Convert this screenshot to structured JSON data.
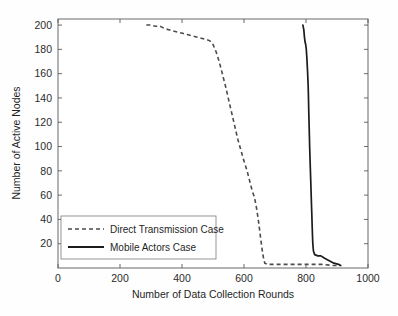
{
  "chart_data": {
    "type": "line",
    "title": "",
    "xlabel": "Number of Data Collection Rounds",
    "ylabel": "Number of Active Nodes",
    "xlim": [
      0,
      1000
    ],
    "ylim": [
      0,
      205
    ],
    "xticks": [
      0,
      200,
      400,
      600,
      800,
      1000
    ],
    "yticks": [
      20,
      40,
      60,
      80,
      100,
      120,
      140,
      160,
      180,
      200
    ],
    "xtick_labels": [
      "0",
      "200",
      "400",
      "600",
      "800",
      "1000"
    ],
    "ytick_labels": [
      "20",
      "40",
      "60",
      "80",
      "100",
      "120",
      "140",
      "160",
      "180",
      "200"
    ],
    "grid": false,
    "legend_position": "lower left",
    "series": [
      {
        "name": "Direct Transmission Case",
        "style": "dashed",
        "color": "#4b4b4b",
        "points": [
          [
            285,
            200
          ],
          [
            300,
            200
          ],
          [
            315,
            199
          ],
          [
            330,
            199
          ],
          [
            345,
            197
          ],
          [
            360,
            196
          ],
          [
            375,
            195
          ],
          [
            390,
            194
          ],
          [
            405,
            193
          ],
          [
            420,
            192
          ],
          [
            435,
            191
          ],
          [
            450,
            190
          ],
          [
            465,
            189
          ],
          [
            480,
            188
          ],
          [
            490,
            187
          ],
          [
            500,
            184
          ],
          [
            510,
            178
          ],
          [
            520,
            170
          ],
          [
            530,
            160
          ],
          [
            540,
            150
          ],
          [
            550,
            139
          ],
          [
            560,
            128
          ],
          [
            570,
            117
          ],
          [
            580,
            106
          ],
          [
            590,
            97
          ],
          [
            600,
            88
          ],
          [
            610,
            80
          ],
          [
            618,
            72
          ],
          [
            626,
            64
          ],
          [
            634,
            58
          ],
          [
            640,
            50
          ],
          [
            646,
            40
          ],
          [
            652,
            28
          ],
          [
            658,
            16
          ],
          [
            663,
            8
          ],
          [
            667,
            4
          ],
          [
            675,
            3
          ],
          [
            700,
            3
          ],
          [
            750,
            3
          ],
          [
            800,
            3
          ],
          [
            850,
            3
          ],
          [
            890,
            2
          ],
          [
            910,
            2
          ]
        ]
      },
      {
        "name": "Mobile Actors  Case",
        "style": "solid",
        "color": "#1c1c1c",
        "points": [
          [
            790,
            200
          ],
          [
            793,
            196
          ],
          [
            795,
            190
          ],
          [
            797,
            186
          ],
          [
            799,
            184
          ],
          [
            801,
            180
          ],
          [
            803,
            172
          ],
          [
            805,
            162
          ],
          [
            807,
            150
          ],
          [
            808,
            140
          ],
          [
            809,
            128
          ],
          [
            810,
            118
          ],
          [
            811,
            108
          ],
          [
            812,
            98
          ],
          [
            813,
            90
          ],
          [
            814,
            82
          ],
          [
            815,
            74
          ],
          [
            816,
            66
          ],
          [
            817,
            58
          ],
          [
            818,
            50
          ],
          [
            819,
            42
          ],
          [
            820,
            34
          ],
          [
            821,
            26
          ],
          [
            822,
            20
          ],
          [
            824,
            14
          ],
          [
            828,
            11
          ],
          [
            838,
            10
          ],
          [
            848,
            10
          ],
          [
            860,
            8
          ],
          [
            875,
            6
          ],
          [
            890,
            4
          ],
          [
            905,
            3
          ],
          [
            912,
            2
          ]
        ]
      }
    ]
  },
  "legend": {
    "items": [
      {
        "label": "Direct Transmission Case",
        "style": "dashed"
      },
      {
        "label": "Mobile Actors  Case",
        "style": "solid"
      }
    ]
  }
}
